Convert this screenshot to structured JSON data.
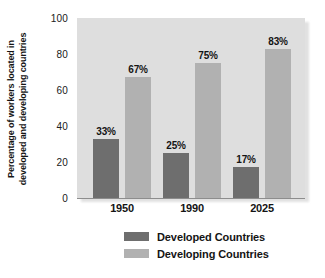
{
  "chart_data": {
    "type": "bar",
    "title": "",
    "xlabel": "",
    "ylabel_line1": "Percentage of workers located in",
    "ylabel_line2": "developed and developing countries",
    "categories": [
      "1950",
      "1990",
      "2025"
    ],
    "yticks": [
      "100",
      "80",
      "60",
      "40",
      "20",
      "0"
    ],
    "ylim": [
      0,
      100
    ],
    "grid": false,
    "legend_position": "bottom",
    "series": [
      {
        "name": "Developed Countries",
        "color": "#6e6e6e",
        "values": [
          33,
          25,
          17
        ],
        "labels": [
          "33%",
          "25%",
          "17%"
        ]
      },
      {
        "name": "Developing Countries",
        "color": "#b1b1b1",
        "values": [
          67,
          75,
          83
        ],
        "labels": [
          "67%",
          "75%",
          "83%"
        ]
      }
    ],
    "plot_background": "#dedede"
  }
}
